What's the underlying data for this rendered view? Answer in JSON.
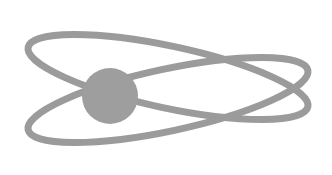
{
  "image": {
    "kind": "atom-orbit-logo",
    "width": 332,
    "height": 175,
    "background_color": "#ffffff",
    "alt_text": "Atom logo: two crossing elliptical orbits around a solid gray nucleus"
  },
  "colors": {
    "orbit_stroke": "#9b9b9b",
    "nucleus_fill": "#9e9e9e",
    "background": "#ffffff"
  },
  "nucleus": {
    "label": "nucleus",
    "cx": 110,
    "cy": 96,
    "r": 28,
    "fill": "#9e9e9e"
  },
  "orbits": [
    {
      "label": "orbit-upper",
      "cx": 168,
      "cy": 77,
      "rx": 143,
      "ry": 31,
      "rotation_deg": 12,
      "stroke": "#9b9b9b",
      "stroke_width": 7
    },
    {
      "label": "orbit-lower",
      "cx": 168,
      "cy": 100,
      "rx": 143,
      "ry": 31,
      "rotation_deg": -12,
      "stroke": "#9b9b9b",
      "stroke_width": 7
    }
  ],
  "crossings": [
    {
      "label": "crossing-upper-left",
      "x": 181,
      "y": 69
    },
    {
      "label": "crossing-lower-left",
      "x": 183,
      "y": 125
    },
    {
      "label": "crossing-right",
      "x": 240,
      "y": 98
    }
  ]
}
